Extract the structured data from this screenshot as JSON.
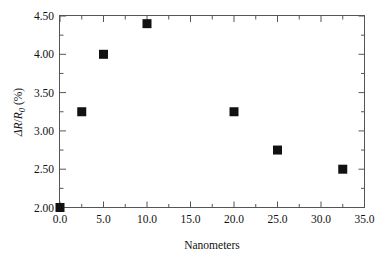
{
  "chart_data": {
    "type": "scatter",
    "title": "",
    "subtitle": "",
    "xlabel": "Nanometers",
    "ylabel": "ΔR/R0 (%)",
    "ylabel_parts": {
      "delta": "Δ",
      "r_numer": "R",
      "slash": "/",
      "r_denom": "R",
      "subscript": "0",
      "units": " (%)"
    },
    "xlim": [
      0.0,
      35.0
    ],
    "ylim": [
      2.0,
      4.5
    ],
    "xticks": [
      0.0,
      5.0,
      10.0,
      15.0,
      20.0,
      25.0,
      30.0,
      35.0
    ],
    "xticklabels": [
      "0.0",
      "5.0",
      "10.0",
      "15.0",
      "20.0",
      "25.0",
      "30.0",
      "35.0"
    ],
    "xminor_step": 2.5,
    "yticks": [
      2.0,
      2.5,
      3.0,
      3.5,
      4.0,
      4.5
    ],
    "yticklabels": [
      "2.00",
      "2.50",
      "3.00",
      "3.50",
      "4.00",
      "4.50"
    ],
    "yminor_step": 0.25,
    "grid": false,
    "legend": false,
    "legend_position": "none",
    "marker": {
      "shape": "square",
      "color": "#111111",
      "size_px": 9
    },
    "series": [
      {
        "name": "ΔR/R0",
        "points": [
          {
            "x": 0.0,
            "y": 2.0
          },
          {
            "x": 2.5,
            "y": 3.25
          },
          {
            "x": 5.0,
            "y": 4.0
          },
          {
            "x": 10.0,
            "y": 4.4
          },
          {
            "x": 20.0,
            "y": 3.25
          },
          {
            "x": 25.0,
            "y": 2.75
          },
          {
            "x": 32.5,
            "y": 2.5
          }
        ]
      }
    ],
    "frame": {
      "color": "#555555",
      "width_px": 1,
      "sides": [
        "left",
        "right",
        "top",
        "bottom"
      ]
    }
  }
}
